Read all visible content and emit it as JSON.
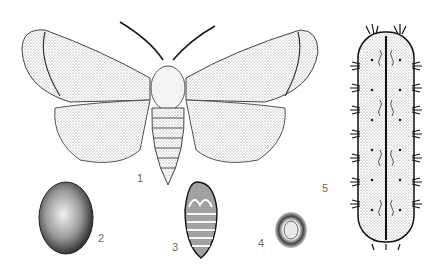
{
  "figure": {
    "labels": [
      {
        "id": "1",
        "text": "1",
        "stage": "adult moth"
      },
      {
        "id": "2",
        "text": "2",
        "stage": "cocoon"
      },
      {
        "id": "3",
        "text": "3",
        "stage": "pupa"
      },
      {
        "id": "4",
        "text": "4",
        "stage": "egg"
      },
      {
        "id": "5",
        "text": "5",
        "stage": "larva (caterpillar)"
      }
    ],
    "colors": {
      "ink": "#1a1a1a",
      "stipple": "#555555",
      "background": "#ffffff",
      "label": "#6a6a6a"
    }
  }
}
